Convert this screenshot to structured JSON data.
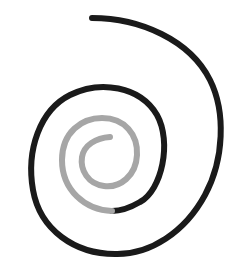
{
  "diagram": {
    "type": "spiral",
    "direction": "clockwise inward",
    "background_color": "#ffffff",
    "segments": [
      {
        "name": "outer-spiral-segment",
        "color": "#1a1a1a",
        "stroke_width": 6,
        "description": "Outer portion of spiral, black"
      },
      {
        "name": "inner-spiral-segment",
        "color": "#a6a6a6",
        "stroke_width": 6,
        "description": "Inner portion of spiral, gray"
      }
    ]
  }
}
